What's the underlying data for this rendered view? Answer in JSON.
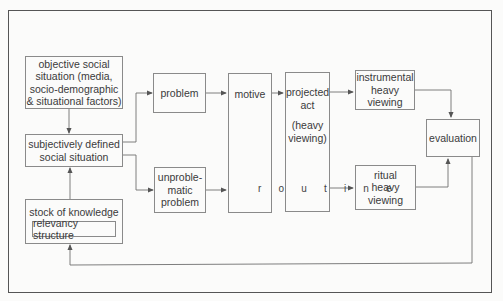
{
  "diagram": {
    "nodes": {
      "objective": {
        "lines": [
          "objective social",
          "situation (media,",
          "socio-demographic",
          "& situational factors)"
        ]
      },
      "subjective": {
        "lines": [
          "subjectively defined",
          "social situation"
        ]
      },
      "stock": {
        "label": "stock of knowledge",
        "inner": "relevancy structure"
      },
      "problem": {
        "label": "problem"
      },
      "unproblematic": {
        "lines": [
          "unproble-",
          "matic",
          "problem"
        ]
      },
      "motive": {
        "label": "motive"
      },
      "projected": {
        "lines": [
          "projected",
          "act",
          "",
          "(heavy",
          "viewing)"
        ]
      },
      "instrumental": {
        "lines": [
          "instrumental",
          "heavy",
          "viewing"
        ]
      },
      "ritual": {
        "lines": [
          "ritual",
          "heavy",
          "viewing"
        ]
      },
      "evaluation": {
        "label": "evaluation"
      }
    },
    "routine_label": "r o u t i n e",
    "edges": [
      {
        "from": "objective",
        "to": "subjective"
      },
      {
        "from": "stock",
        "to": "subjective"
      },
      {
        "from": "subjective",
        "to": "problem"
      },
      {
        "from": "subjective",
        "to": "unproblematic"
      },
      {
        "from": "problem",
        "to": "motive"
      },
      {
        "from": "motive",
        "to": "projected"
      },
      {
        "from": "projected",
        "to": "instrumental"
      },
      {
        "from": "unproblematic",
        "to": "routine"
      },
      {
        "from": "routine",
        "to": "ritual"
      },
      {
        "from": "instrumental",
        "to": "evaluation"
      },
      {
        "from": "ritual",
        "to": "evaluation"
      },
      {
        "from": "evaluation",
        "to": "stock"
      }
    ],
    "colors": {
      "line": "#6f6f6f",
      "border": "#8a8a8a",
      "frame": "#555555",
      "background": "#fbfbfa"
    }
  }
}
